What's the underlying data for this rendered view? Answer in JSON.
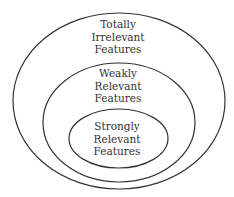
{
  "diagram": {
    "type": "nested-ellipses",
    "stroke_color": "#333333",
    "outer": {
      "lines": [
        "Totally",
        "Irrelevant",
        "Features"
      ]
    },
    "middle": {
      "lines": [
        "Weakly",
        "Relevant",
        "Features"
      ]
    },
    "inner": {
      "lines": [
        "Strongly",
        "Relevant",
        "Features"
      ]
    }
  }
}
